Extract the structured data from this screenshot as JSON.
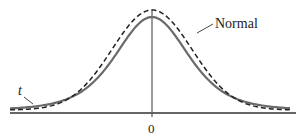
{
  "figure": {
    "title": "",
    "labels": {
      "normal": "Normal",
      "t": "t",
      "zero": "0"
    }
  },
  "chart_data": {
    "type": "line",
    "title": "",
    "xlabel": "",
    "ylabel": "",
    "x_ticks": [
      "0"
    ],
    "series": [
      {
        "name": "Normal",
        "style": "dashed",
        "color": "#222222",
        "description": "standard normal density, taller peak, thinner tails"
      },
      {
        "name": "t",
        "style": "solid",
        "color": "#666666",
        "description": "t distribution density, lower peak, heavier tails"
      }
    ],
    "annotations": [
      "Normal",
      "t"
    ],
    "grid": false,
    "legend": "none (inline labels with leader lines)"
  }
}
